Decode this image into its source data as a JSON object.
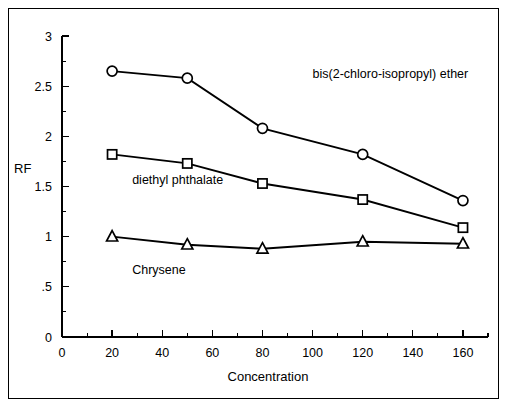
{
  "chart_data": {
    "type": "line",
    "title": "",
    "xlabel": "Concentration",
    "ylabel": "RF",
    "xlim": [
      0,
      170
    ],
    "ylim": [
      0,
      3
    ],
    "grid": false,
    "legend_position": "inline-annotations",
    "x": [
      20,
      50,
      80,
      120,
      160
    ],
    "xticks": [
      0,
      20,
      40,
      60,
      80,
      100,
      120,
      140,
      160
    ],
    "xtick_labels": [
      "0",
      "20",
      "40",
      "60",
      "80",
      "100",
      "120",
      "140",
      "160"
    ],
    "xminor_step": 10,
    "yticks": [
      0,
      0.5,
      1,
      1.5,
      2,
      2.5,
      3
    ],
    "ytick_labels": [
      "0",
      ".5",
      "1",
      "1.5",
      "2",
      "2.5",
      "3"
    ],
    "yminor_step": 0.25,
    "series": [
      {
        "name": "bis(2-chloro-isopropyl) ether",
        "marker": "circle",
        "values": [
          2.65,
          2.58,
          2.08,
          1.82,
          1.36
        ],
        "label_x": 100,
        "label_y": 2.58
      },
      {
        "name": "diethyl phthalate",
        "marker": "square",
        "values": [
          1.82,
          1.73,
          1.53,
          1.37,
          1.09
        ],
        "label_x": 28,
        "label_y": 1.52
      },
      {
        "name": "Chrysene",
        "marker": "triangle",
        "values": [
          1.0,
          0.92,
          0.88,
          0.95,
          0.93
        ],
        "label_x": 28,
        "label_y": 0.63
      }
    ],
    "colors": {
      "line": "#000000",
      "marker_fill": "#ffffff",
      "axis": "#000000",
      "background": "#ffffff",
      "frame": "#000000"
    }
  }
}
